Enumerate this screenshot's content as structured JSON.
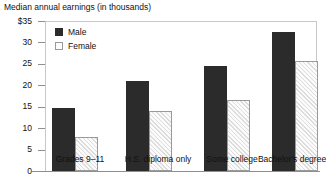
{
  "chart_data": {
    "type": "bar",
    "title": "Median annual earnings (in thousands)",
    "xlabel": "",
    "ylabel": "",
    "ylim": [
      0,
      35
    ],
    "yticks": [
      0,
      5,
      10,
      15,
      20,
      25,
      30,
      35
    ],
    "ytick_labels": [
      "0",
      "5",
      "10",
      "15",
      "20",
      "25",
      "30",
      "$35"
    ],
    "grid": false,
    "legend_position": "top-left",
    "categories": [
      "Grades 9–11",
      "H.S. diploma only",
      "Some college",
      "Bachelor's degree"
    ],
    "series": [
      {
        "name": "Male",
        "values": [
          14.7,
          21.0,
          24.5,
          32.5
        ],
        "color": "#2b2b2b"
      },
      {
        "name": "Female",
        "values": [
          8.0,
          14.0,
          16.5,
          25.7
        ],
        "color": "#fbfbfb"
      }
    ]
  }
}
